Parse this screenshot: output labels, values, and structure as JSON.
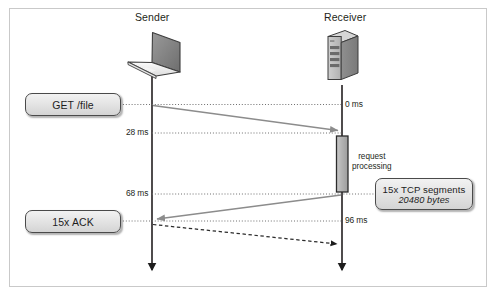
{
  "diagram": {
    "title_sender": "Sender",
    "title_receiver": "Receiver",
    "icons": {
      "sender": "laptop-icon",
      "receiver": "server-icon"
    },
    "timeline_labels": [
      {
        "text": "0 ms",
        "side": "receiver"
      },
      {
        "text": "28 ms",
        "side": "sender"
      },
      {
        "text": "68 ms",
        "side": "sender"
      },
      {
        "text": "96 ms",
        "side": "receiver"
      }
    ],
    "callouts": [
      {
        "line1": "GET /file",
        "line2": ""
      },
      {
        "line1": "15x ACK",
        "line2": ""
      },
      {
        "line1": "15x TCP segments",
        "line2": "20480 bytes"
      }
    ],
    "activation_label": "request\nprocessing",
    "activation_label_line1": "request",
    "activation_label_line2": "processing",
    "colors": {
      "arrow_gray": "#8c8c8c",
      "lifeline": "#231f20",
      "dotted": "#6f6f6f",
      "dashed": "#2b2b2b",
      "box_fill": "#e4e4e4",
      "box_stroke": "#4a4a4a",
      "frame": "#c9c9c9"
    }
  }
}
